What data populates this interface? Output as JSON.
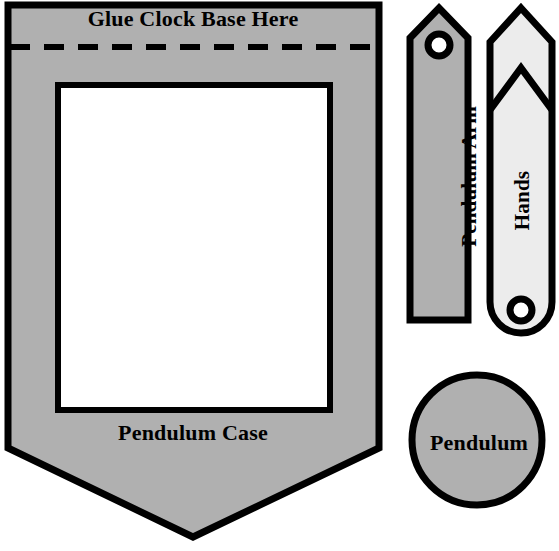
{
  "sheet": {
    "title": "Clock Craft Cut-Out Template",
    "background_color": "#ffffff",
    "width": 559,
    "height": 551
  },
  "colors": {
    "outline": "#000000",
    "gray_fill": "#b0b0b0",
    "light_fill": "#ececec",
    "white_fill": "#ffffff"
  },
  "pieces": [
    {
      "id": "pendulum-case",
      "label": "Pendulum Case",
      "shape": "pentagon-point-down",
      "fill": "#b0b0b0",
      "has_window": true,
      "window_fill": "#ffffff"
    },
    {
      "id": "glue-area",
      "label": "Glue Clock Base Here",
      "shape": "top-strip",
      "divider": "dashed-fold-line"
    },
    {
      "id": "pendulum-arm",
      "label": "Pendulum Arm",
      "shape": "pointed-top-rectangle",
      "fill": "#b0b0b0",
      "has_hole": true,
      "orientation": "vertical"
    },
    {
      "id": "hands",
      "label": "Hands",
      "shape": "arrow-with-chevron-notch",
      "fill": "#ececec",
      "has_hole": true,
      "orientation": "vertical"
    },
    {
      "id": "pendulum",
      "label": "Pendulum",
      "shape": "circle",
      "fill": "#b0b0b0",
      "has_hole": false
    }
  ],
  "labels": {
    "glue_clock_base_here": "Glue Clock Base Here",
    "pendulum_case": "Pendulum Case",
    "pendulum_arm": "Pendulum Arm",
    "hands": "Hands",
    "pendulum": "Pendulum"
  }
}
